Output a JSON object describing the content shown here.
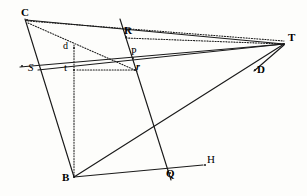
{
  "figure": {
    "background_color": "#fdfdfb",
    "ink_color": "#1a1a1a",
    "width": 307,
    "height": 196,
    "points": [
      {
        "id": "C",
        "label": "C",
        "x": 27,
        "y": 20,
        "label_x": 21,
        "label_y": 7,
        "style": "bold",
        "size": 11
      },
      {
        "id": "R",
        "label": "R",
        "x": 126,
        "y": 37,
        "label_x": 124,
        "label_y": 25,
        "style": "bold",
        "size": 11
      },
      {
        "id": "T",
        "label": "T",
        "x": 284,
        "y": 44,
        "label_x": 288,
        "label_y": 32,
        "style": "bold",
        "size": 11
      },
      {
        "id": "P",
        "label": "P",
        "x": 133,
        "y": 58,
        "label_x": 131,
        "label_y": 47,
        "style": "plain",
        "size": 10
      },
      {
        "id": "D",
        "label": "D",
        "x": 255,
        "y": 70,
        "label_x": 257,
        "label_y": 64,
        "style": "bold",
        "size": 11
      },
      {
        "id": "d",
        "label": "d",
        "x": 74,
        "y": 48,
        "label_x": 63,
        "label_y": 41,
        "style": "plain",
        "size": 10
      },
      {
        "id": "S",
        "label": "S",
        "x": 22,
        "y": 66,
        "label_x": 28,
        "label_y": 62,
        "style": "italic",
        "size": 11
      },
      {
        "id": "t",
        "label": "t",
        "x": 74,
        "y": 70,
        "label_x": 64,
        "label_y": 62,
        "style": "plain",
        "size": 11
      },
      {
        "id": "r",
        "label": "r",
        "x": 135,
        "y": 70,
        "label_x": 136,
        "label_y": 62,
        "style": "bolditalic",
        "size": 10
      },
      {
        "id": "B",
        "label": "B",
        "x": 74,
        "y": 177,
        "label_x": 62,
        "label_y": 172,
        "style": "bold",
        "size": 11
      },
      {
        "id": "Q",
        "label": "Q",
        "x": 170,
        "y": 173,
        "label_x": 166,
        "label_y": 168,
        "style": "bold",
        "size": 11
      },
      {
        "id": "H",
        "label": "H",
        "x": 205,
        "y": 165,
        "label_x": 207,
        "label_y": 154,
        "style": "plain",
        "size": 11
      }
    ],
    "solid_segments": [
      {
        "name": "segment-C-B",
        "from": "C",
        "to": "B",
        "x1": 25,
        "y1": 19,
        "x2": 74,
        "y2": 177
      },
      {
        "name": "segment-C-T",
        "from": "C",
        "to": "T",
        "x1": 26,
        "y1": 20,
        "x2": 284,
        "y2": 44
      },
      {
        "name": "segment-S-T",
        "from": "S",
        "to": "T",
        "x1": 20,
        "y1": 67,
        "x2": 284,
        "y2": 44
      },
      {
        "name": "segment-B-T",
        "from": "B",
        "to": "T",
        "x1": 74,
        "y1": 177,
        "x2": 284,
        "y2": 44
      },
      {
        "name": "segment-R-Q",
        "from": "R",
        "to": "Q",
        "x1": 120,
        "y1": 19,
        "x2": 171,
        "y2": 180
      },
      {
        "name": "segment-B-H",
        "from": "B",
        "to": "H",
        "x1": 74,
        "y1": 177,
        "x2": 203,
        "y2": 165
      },
      {
        "name": "segment-T-D-S",
        "from": "T",
        "to": "S",
        "x1": 284,
        "y1": 44,
        "x2": 38,
        "y2": 70
      },
      {
        "name": "segment-T-D",
        "from": "T",
        "to": "D",
        "x1": 284,
        "y1": 45,
        "x2": 254,
        "y2": 71
      }
    ],
    "dotted_segments": [
      {
        "name": "dotted-C-T",
        "from": "C",
        "to": "T",
        "x1": 28,
        "y1": 21,
        "x2": 284,
        "y2": 41
      },
      {
        "name": "dotted-C-r",
        "from": "C",
        "to": "r",
        "x1": 28,
        "y1": 23,
        "x2": 137,
        "y2": 71
      },
      {
        "name": "dotted-R-T",
        "from": "R",
        "to": "T",
        "x1": 126,
        "y1": 38,
        "x2": 283,
        "y2": 44
      },
      {
        "name": "dotted-d-B",
        "from": "d",
        "to": "B",
        "x1": 74,
        "y1": 45,
        "x2": 74,
        "y2": 176
      },
      {
        "name": "dotted-t-r",
        "from": "t",
        "to": "r",
        "x1": 77,
        "y1": 70,
        "x2": 134,
        "y2": 70
      }
    ]
  }
}
